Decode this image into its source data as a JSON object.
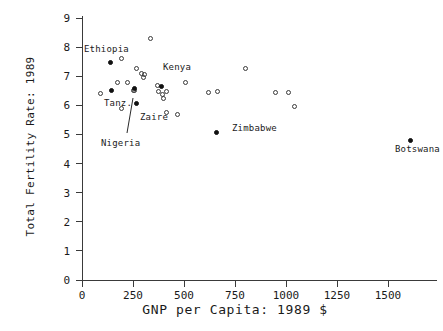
{
  "chart_data": {
    "type": "scatter",
    "title": "",
    "xlabel": "GNP per Capita: 1989 $",
    "ylabel": "Total Fertility Rate: 1989",
    "xlim": [
      -120,
      1660
    ],
    "ylim": [
      -0.45,
      9.4
    ],
    "xticks": [
      0,
      250,
      500,
      750,
      1000,
      1250,
      1500
    ],
    "xtick_labels": [
      "0",
      "250",
      "500",
      "750",
      "1000",
      "1250",
      "1500"
    ],
    "yticks": [
      0,
      1,
      2,
      3,
      4,
      5,
      6,
      7,
      8,
      9
    ],
    "ytick_labels": [
      "0",
      "1",
      "2",
      "3",
      "4",
      "5",
      "6",
      "7",
      "8",
      "9"
    ],
    "grid": false,
    "legend": "none",
    "series": [
      {
        "name": "unlabeled-countries",
        "marker": "open-circle",
        "points": [
          {
            "x": 90,
            "y": 6.4
          },
          {
            "x": 195,
            "y": 7.6
          },
          {
            "x": 175,
            "y": 6.8
          },
          {
            "x": 225,
            "y": 6.8
          },
          {
            "x": 250,
            "y": 6.5
          },
          {
            "x": 255,
            "y": 6.5
          },
          {
            "x": 195,
            "y": 5.88
          },
          {
            "x": 265,
            "y": 7.28
          },
          {
            "x": 290,
            "y": 7.1
          },
          {
            "x": 300,
            "y": 6.95
          },
          {
            "x": 305,
            "y": 7.05
          },
          {
            "x": 335,
            "y": 8.28
          },
          {
            "x": 370,
            "y": 6.68
          },
          {
            "x": 375,
            "y": 6.48
          },
          {
            "x": 395,
            "y": 6.38
          },
          {
            "x": 400,
            "y": 6.25
          },
          {
            "x": 415,
            "y": 6.48
          },
          {
            "x": 415,
            "y": 5.75
          },
          {
            "x": 470,
            "y": 5.68
          },
          {
            "x": 505,
            "y": 6.78
          },
          {
            "x": 620,
            "y": 6.45
          },
          {
            "x": 665,
            "y": 6.48
          },
          {
            "x": 800,
            "y": 7.25
          },
          {
            "x": 950,
            "y": 6.45
          },
          {
            "x": 1010,
            "y": 6.45
          },
          {
            "x": 1040,
            "y": 5.95
          }
        ]
      },
      {
        "name": "labeled-countries",
        "marker": "filled-circle",
        "points": [
          {
            "x": 140,
            "y": 7.48,
            "label": "Ethiopia"
          },
          {
            "x": 145,
            "y": 6.5,
            "label": "Tanz."
          },
          {
            "x": 255,
            "y": 6.58,
            "label": "Nigeria"
          },
          {
            "x": 265,
            "y": 6.08,
            "label": "Zaire"
          },
          {
            "x": 390,
            "y": 6.65,
            "label": "Kenya"
          },
          {
            "x": 660,
            "y": 5.05,
            "label": "Zimbabwe"
          },
          {
            "x": 1610,
            "y": 4.8,
            "label": "Botswana"
          }
        ]
      }
    ],
    "annotations": [
      {
        "text": "Ethiopia",
        "px": 84,
        "py": 45
      },
      {
        "text": "Kenya",
        "px": 163,
        "py": 63
      },
      {
        "text": "Tanz.",
        "px": 104,
        "py": 99
      },
      {
        "text": "Zaire",
        "px": 140,
        "py": 113
      },
      {
        "text": "Nigeria",
        "px": 101,
        "py": 139
      },
      {
        "text": "Zimbabwe",
        "px": 232,
        "py": 124
      },
      {
        "text": "Botswana",
        "px": 395,
        "py": 145
      }
    ],
    "leader_line": {
      "x1": 127,
      "y1": 133,
      "x2": 133,
      "y2": 98
    }
  },
  "axes": {
    "x_axis_name": "x-axis",
    "y_axis_name": "y-axis"
  }
}
